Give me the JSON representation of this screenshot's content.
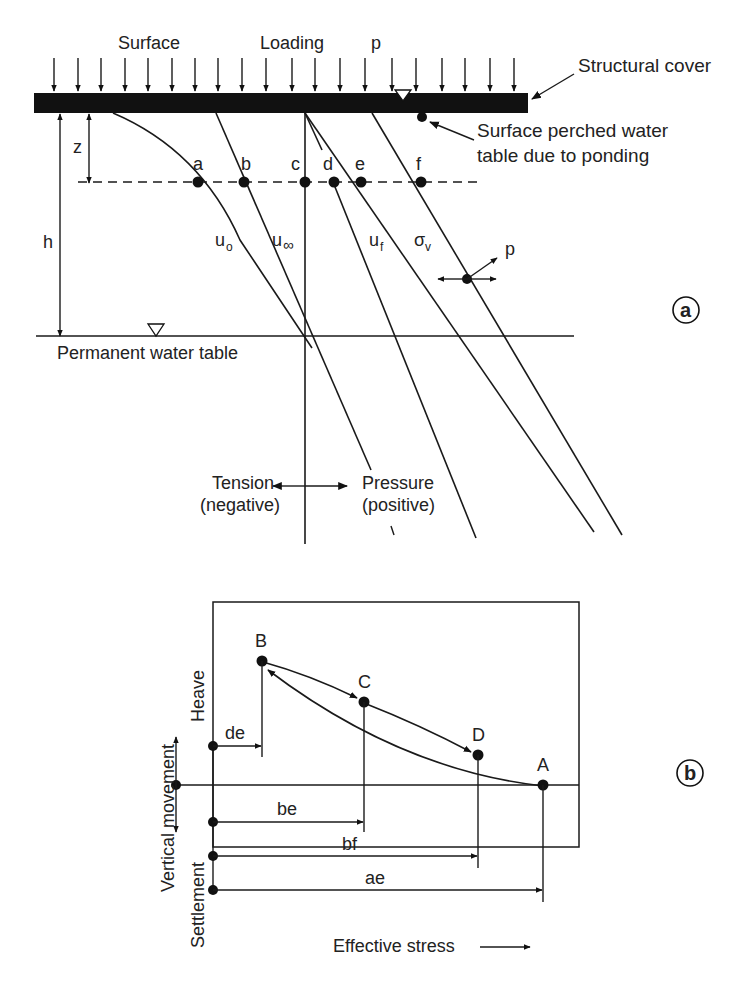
{
  "panel_a": {
    "id_label": "a",
    "top_labels": {
      "surface": "Surface",
      "loading": "Loading",
      "load_symbol": "p"
    },
    "structural_cover": "Structural cover",
    "perched_water_table": [
      "Surface perched water",
      "table due to ponding"
    ],
    "depth_labels": {
      "z": "z",
      "h": "h"
    },
    "points": [
      "a",
      "b",
      "c",
      "d",
      "e",
      "f"
    ],
    "curves": {
      "u0": {
        "main": "u",
        "sub": "o"
      },
      "uinf": {
        "main": "u",
        "sub": "∞"
      },
      "uf": {
        "main": "u",
        "sub": "f"
      },
      "sigma_v": {
        "main": "σ",
        "sub": "v"
      }
    },
    "offset_label": "p",
    "permanent_water_table": "Permanent water table",
    "tension": [
      "Tension",
      "(negative)"
    ],
    "pressure": [
      "Pressure",
      "(positive)"
    ]
  },
  "panel_b": {
    "id_label": "b",
    "points": [
      "A",
      "B",
      "C",
      "D"
    ],
    "dimensions": [
      "de",
      "be",
      "bf",
      "ae"
    ],
    "y_axis": {
      "title": "Vertical movement",
      "up": "Heave",
      "down": "Settlement"
    },
    "x_axis": {
      "title": "Effective stress"
    }
  },
  "colors": {
    "ink": "#1a1a1a",
    "background": "#ffffff"
  }
}
